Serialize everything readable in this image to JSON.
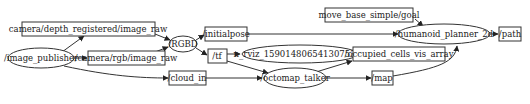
{
  "diagram": {
    "type": "ros-rqt-graph",
    "nodes": [
      {
        "id": "image_publisher",
        "label": "/image_publisher",
        "shape": "ellipse"
      },
      {
        "id": "RGBD",
        "label": "/RGBD",
        "shape": "ellipse"
      },
      {
        "id": "rviz",
        "label": "n_rviz_15901480654130753​08",
        "shape": "ellipse"
      },
      {
        "id": "octomap_talker",
        "label": "/octomap_talker",
        "shape": "ellipse"
      },
      {
        "id": "humanoid_planner_2d",
        "label": "/humanoid_planner_2d",
        "shape": "ellipse"
      }
    ],
    "topics": [
      {
        "id": "depth_image",
        "label": "camera/depth_registered/image_raw",
        "shape": "box"
      },
      {
        "id": "rgb_image",
        "label": "/camera/rgb/image_raw",
        "shape": "box"
      },
      {
        "id": "cloud_in",
        "label": "/cloud_in",
        "shape": "box"
      },
      {
        "id": "initialpose",
        "label": "/initialpose",
        "shape": "box"
      },
      {
        "id": "tf",
        "label": "/tf",
        "shape": "box"
      },
      {
        "id": "occupied_cells",
        "label": "/occupied_cells_vis_array",
        "shape": "box"
      },
      {
        "id": "map",
        "label": "/map",
        "shape": "box"
      },
      {
        "id": "goal",
        "label": "move_base_simple/goal",
        "shape": "box"
      },
      {
        "id": "path",
        "label": "/path",
        "shape": "box"
      }
    ],
    "edges": [
      [
        "image_publisher",
        "depth_image"
      ],
      [
        "image_publisher",
        "rgb_image"
      ],
      [
        "image_publisher",
        "cloud_in"
      ],
      [
        "depth_image",
        "RGBD"
      ],
      [
        "rgb_image",
        "RGBD"
      ],
      [
        "RGBD",
        "initialpose"
      ],
      [
        "RGBD",
        "tf"
      ],
      [
        "initialpose",
        "humanoid_planner_2d"
      ],
      [
        "tf",
        "rviz"
      ],
      [
        "tf",
        "octomap_talker"
      ],
      [
        "cloud_in",
        "octomap_talker"
      ],
      [
        "octomap_talker",
        "occupied_cells"
      ],
      [
        "octomap_talker",
        "map"
      ],
      [
        "map",
        "humanoid_planner_2d"
      ],
      [
        "goal",
        "humanoid_planner_2d"
      ],
      [
        "humanoid_planner_2d",
        "path"
      ]
    ]
  },
  "labels": {
    "image_publisher": "/image_publisher",
    "RGBD": "/RGBD",
    "rviz": "n_rviz_1590148065413075308",
    "octomap_talker": "/octomap_talker",
    "humanoid_planner_2d": "/humanoid_planner_2d",
    "depth_image": "camera/depth_registered/image_raw",
    "rgb_image": "/camera/rgb/image_raw",
    "cloud_in": "/cloud_in",
    "initialpose": "/initialpose",
    "tf": "/tf",
    "occupied_cells": "/occupied_cells_vis_array",
    "map": "/map",
    "goal": "move_base_simple/goal",
    "path": "/path"
  }
}
